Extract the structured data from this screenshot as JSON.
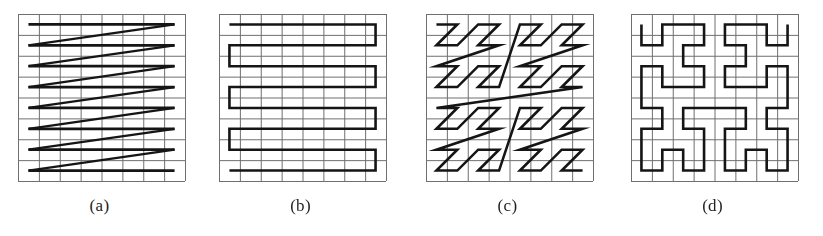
{
  "figure": {
    "background_color": "#ffffff",
    "grid_color": "#6f6f6f",
    "curve_color": "#151515",
    "caption_color": "#231f20",
    "grid_cells": 8,
    "panels": [
      {
        "id": "a",
        "caption": "(a)",
        "name": "raster-scan",
        "curve_type": "raster",
        "grid_cols": 8,
        "grid_rows": 8,
        "description": "Row-major raster scan with diagonal retrace lines",
        "order": [
          [
            0,
            0
          ],
          [
            1,
            0
          ],
          [
            2,
            0
          ],
          [
            3,
            0
          ],
          [
            4,
            0
          ],
          [
            5,
            0
          ],
          [
            6,
            0
          ],
          [
            7,
            0
          ],
          [
            0,
            1
          ],
          [
            1,
            1
          ],
          [
            2,
            1
          ],
          [
            3,
            1
          ],
          [
            4,
            1
          ],
          [
            5,
            1
          ],
          [
            6,
            1
          ],
          [
            7,
            1
          ],
          [
            0,
            2
          ],
          [
            1,
            2
          ],
          [
            2,
            2
          ],
          [
            3,
            2
          ],
          [
            4,
            2
          ],
          [
            5,
            2
          ],
          [
            6,
            2
          ],
          [
            7,
            2
          ],
          [
            0,
            3
          ],
          [
            1,
            3
          ],
          [
            2,
            3
          ],
          [
            3,
            3
          ],
          [
            4,
            3
          ],
          [
            5,
            3
          ],
          [
            6,
            3
          ],
          [
            7,
            3
          ],
          [
            0,
            4
          ],
          [
            1,
            4
          ],
          [
            2,
            4
          ],
          [
            3,
            4
          ],
          [
            4,
            4
          ],
          [
            5,
            4
          ],
          [
            6,
            4
          ],
          [
            7,
            4
          ],
          [
            0,
            5
          ],
          [
            1,
            5
          ],
          [
            2,
            5
          ],
          [
            3,
            5
          ],
          [
            4,
            5
          ],
          [
            5,
            5
          ],
          [
            6,
            5
          ],
          [
            7,
            5
          ],
          [
            0,
            6
          ],
          [
            1,
            6
          ],
          [
            2,
            6
          ],
          [
            3,
            6
          ],
          [
            4,
            6
          ],
          [
            5,
            6
          ],
          [
            6,
            6
          ],
          [
            7,
            6
          ],
          [
            0,
            7
          ],
          [
            1,
            7
          ],
          [
            2,
            7
          ],
          [
            3,
            7
          ],
          [
            4,
            7
          ],
          [
            5,
            7
          ],
          [
            6,
            7
          ],
          [
            7,
            7
          ]
        ]
      },
      {
        "id": "b",
        "caption": "(b)",
        "name": "boustrophedon-scan",
        "curve_type": "boustrophedon",
        "grid_cols": 8,
        "grid_rows": 8,
        "description": "Serpentine snake scan alternating direction each row",
        "order": [
          [
            0,
            0
          ],
          [
            1,
            0
          ],
          [
            2,
            0
          ],
          [
            3,
            0
          ],
          [
            4,
            0
          ],
          [
            5,
            0
          ],
          [
            6,
            0
          ],
          [
            7,
            0
          ],
          [
            7,
            1
          ],
          [
            6,
            1
          ],
          [
            5,
            1
          ],
          [
            4,
            1
          ],
          [
            3,
            1
          ],
          [
            2,
            1
          ],
          [
            1,
            1
          ],
          [
            0,
            1
          ],
          [
            0,
            2
          ],
          [
            1,
            2
          ],
          [
            2,
            2
          ],
          [
            3,
            2
          ],
          [
            4,
            2
          ],
          [
            5,
            2
          ],
          [
            6,
            2
          ],
          [
            7,
            2
          ],
          [
            7,
            3
          ],
          [
            6,
            3
          ],
          [
            5,
            3
          ],
          [
            4,
            3
          ],
          [
            3,
            3
          ],
          [
            2,
            3
          ],
          [
            1,
            3
          ],
          [
            0,
            3
          ],
          [
            0,
            4
          ],
          [
            1,
            4
          ],
          [
            2,
            4
          ],
          [
            3,
            4
          ],
          [
            4,
            4
          ],
          [
            5,
            4
          ],
          [
            6,
            4
          ],
          [
            7,
            4
          ],
          [
            7,
            5
          ],
          [
            6,
            5
          ],
          [
            5,
            5
          ],
          [
            4,
            5
          ],
          [
            3,
            5
          ],
          [
            2,
            5
          ],
          [
            1,
            5
          ],
          [
            0,
            5
          ],
          [
            0,
            6
          ],
          [
            1,
            6
          ],
          [
            2,
            6
          ],
          [
            3,
            6
          ],
          [
            4,
            6
          ],
          [
            5,
            6
          ],
          [
            6,
            6
          ],
          [
            7,
            6
          ],
          [
            7,
            7
          ],
          [
            6,
            7
          ],
          [
            5,
            7
          ],
          [
            4,
            7
          ],
          [
            3,
            7
          ],
          [
            2,
            7
          ],
          [
            1,
            7
          ],
          [
            0,
            7
          ]
        ]
      },
      {
        "id": "c",
        "caption": "(c)",
        "name": "morton-z-order-curve",
        "curve_type": "morton",
        "grid_cols": 8,
        "grid_rows": 8,
        "description": "Z-order / Morton space-filling curve, recursive Z shapes"
      },
      {
        "id": "d",
        "caption": "(d)",
        "name": "hilbert-curve",
        "curve_type": "hilbert",
        "grid_cols": 8,
        "grid_rows": 8,
        "description": "Hilbert space-filling curve, order 3"
      }
    ]
  }
}
